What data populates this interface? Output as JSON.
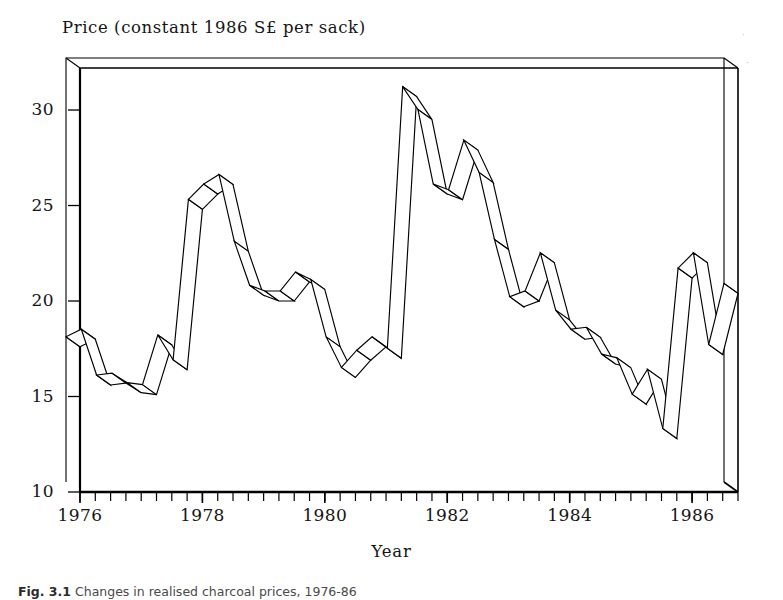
{
  "figure": {
    "caption_prefix": "Fig. 3.1",
    "caption_text": "Changes in realised charcoal prices, 1976-86",
    "x_axis_title": "Year",
    "y_axis_title": "Price (constant 1986 S£ per sack)"
  },
  "axes": {
    "y_ticks": [
      "10",
      "15",
      "20",
      "25",
      "30"
    ],
    "x_ticks": [
      "1976",
      "1978",
      "1980",
      "1982",
      "1984",
      "1986"
    ],
    "y_min": 10,
    "y_max": 32.2,
    "x_min": 1976.0,
    "x_max": 1986.75,
    "minor_tick_interval_quarters": 1,
    "grid": "off",
    "line_color": "#000000",
    "background_color": "#ffffff"
  },
  "chart_data": {
    "type": "line",
    "title": "Price (constant 1986 S£ per sack)",
    "subtitle": "",
    "xlabel": "Year",
    "ylabel": "Price (constant 1986 S£ per sack)",
    "xlim": [
      1976.0,
      1986.75
    ],
    "ylim": [
      10,
      32.2
    ],
    "grid": false,
    "legend": "none",
    "style": "3d-ribbon-line",
    "x_tick_labels": [
      "1976",
      "1978",
      "1980",
      "1982",
      "1984",
      "1986"
    ],
    "y_tick_labels": [
      "10",
      "15",
      "20",
      "25",
      "30"
    ],
    "x": [
      1976.0,
      1976.25,
      1976.5,
      1976.75,
      1977.0,
      1977.25,
      1977.5,
      1977.75,
      1978.0,
      1978.25,
      1978.5,
      1978.75,
      1979.0,
      1979.25,
      1979.5,
      1979.75,
      1980.0,
      1980.25,
      1980.5,
      1980.75,
      1981.0,
      1981.25,
      1981.5,
      1981.75,
      1982.0,
      1982.25,
      1982.5,
      1982.75,
      1983.0,
      1983.25,
      1983.5,
      1983.75,
      1984.0,
      1984.25,
      1984.5,
      1984.75,
      1985.0,
      1985.25,
      1985.5,
      1985.75,
      1986.0,
      1986.25,
      1986.5,
      1986.75
    ],
    "values": [
      17.6,
      18.0,
      15.6,
      15.7,
      15.2,
      15.1,
      17.7,
      16.4,
      24.8,
      25.6,
      26.1,
      22.6,
      20.3,
      20.0,
      20.0,
      21.0,
      20.6,
      17.6,
      16.0,
      16.9,
      17.6,
      17.0,
      30.7,
      29.5,
      25.6,
      25.3,
      27.9,
      26.2,
      22.7,
      19.7,
      20.0,
      22.0,
      19.0,
      18.0,
      18.1,
      16.7,
      16.5,
      14.6,
      15.9,
      12.8,
      21.2,
      22.0,
      17.2,
      20.4
    ],
    "series": [
      {
        "name": "Realised charcoal price",
        "units": "constant 1986 S£ per sack",
        "frequency": "quarterly"
      }
    ],
    "annotations": []
  },
  "icons": {
    "speck_top_right": "dust-speck"
  }
}
